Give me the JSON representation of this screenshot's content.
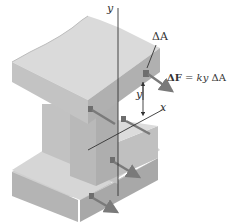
{
  "figure": {
    "labels": {
      "y_axis": "y",
      "x_axis": "x",
      "element_area": "ΔA",
      "force_eq_prefix": "ΔF",
      "force_eq_eq": " = ",
      "force_eq_rhs_k": "ky",
      "force_eq_rhs_area": " ΔA",
      "distance_y": "y"
    },
    "colors": {
      "background": "#ffffff",
      "top_face": "#d9d9d9",
      "side_face_light": "#c4c4c4",
      "side_face_dark": "#a9a9a9",
      "web_face": "#bdbdbd",
      "arrow": "#7a7a7a",
      "axis": "#333333"
    }
  }
}
